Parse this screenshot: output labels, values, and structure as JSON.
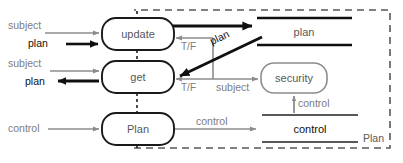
{
  "diagram": {
    "type": "data-flow-diagram",
    "boundary": {
      "label": "Plan",
      "style": "dashed"
    },
    "processes": [
      {
        "id": "update",
        "label": "update",
        "shape": "rounded-rect"
      },
      {
        "id": "get",
        "label": "get",
        "shape": "rounded-rect"
      },
      {
        "id": "plan",
        "label": "Plan",
        "shape": "rounded-rect"
      },
      {
        "id": "security",
        "label": "security",
        "shape": "rounded-rect"
      }
    ],
    "datastores": [
      {
        "id": "plan-store",
        "label": "plan"
      },
      {
        "id": "control-store",
        "label": "control"
      }
    ],
    "flows": [
      {
        "id": "subject-to-update",
        "label": "subject",
        "emphasis": "normal",
        "color": "#8c8c8f"
      },
      {
        "id": "plan-to-update",
        "label": "plan",
        "emphasis": "bold",
        "color": "#101010"
      },
      {
        "id": "subject-to-get",
        "label": "subject",
        "emphasis": "normal",
        "color": "#8c8c8f"
      },
      {
        "id": "plan-from-get",
        "label": "plan",
        "emphasis": "bold",
        "color": "#101010"
      },
      {
        "id": "control-to-plan",
        "label": "control",
        "emphasis": "normal",
        "color": "#8c8c8f"
      },
      {
        "id": "tf-to-update",
        "label": "T/F",
        "emphasis": "normal",
        "color": "#8c8c8f"
      },
      {
        "id": "tf-to-get",
        "label": "T/F",
        "emphasis": "normal",
        "color": "#8c8c8f"
      },
      {
        "id": "update-to-planstore",
        "label": "",
        "emphasis": "bold",
        "color": "#101010"
      },
      {
        "id": "planstore-to-get",
        "label": "plan",
        "emphasis": "bold",
        "color": "#101010"
      },
      {
        "id": "subject-to-security",
        "label": "subject",
        "emphasis": "normal",
        "color": "#8c8c8f"
      },
      {
        "id": "plan-to-controlstore",
        "label": "control",
        "emphasis": "normal",
        "color": "#8c8c8f"
      },
      {
        "id": "control-to-security",
        "label": "control",
        "emphasis": "normal",
        "color": "#8c8c8f"
      }
    ],
    "colors": {
      "gray": "#8c8c8f",
      "gray_text": "#7d7d80",
      "dark_text": "#58585a",
      "black": "#101010",
      "process_stroke": "#1a1a1a",
      "security_stroke": "#8c8c8f",
      "boundary": "#58585a",
      "background": "#ffffff"
    }
  }
}
